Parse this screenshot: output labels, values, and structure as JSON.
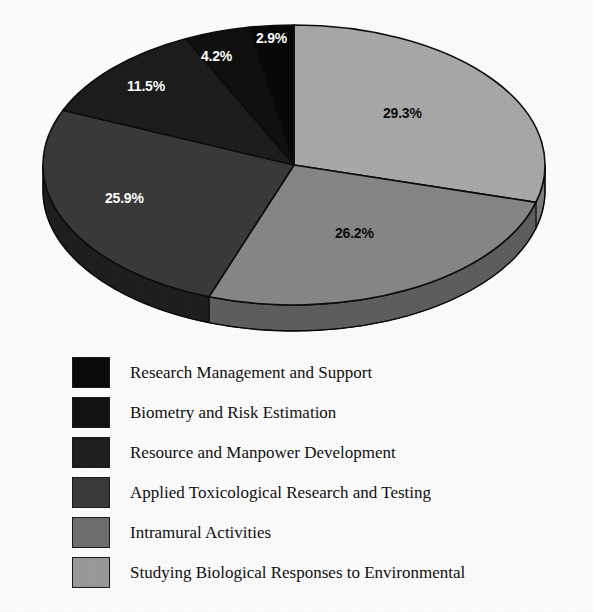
{
  "chart_data": {
    "type": "pie",
    "title": "",
    "subtitle": "",
    "xlabel": "",
    "ylabel": "",
    "grid": false,
    "legend_position": "below",
    "three_d": true,
    "start_angle_deg": 0,
    "direction": "clockwise",
    "categories": [
      "Studying Biological Responses to Environmental",
      "Intramural Activities",
      "Applied Toxicological Research and Testing",
      "Resource and Manpower Development",
      "Biometry and Risk Estimation",
      "Research Management and Support"
    ],
    "values": [
      29.3,
      26.2,
      25.9,
      11.5,
      4.2,
      2.9
    ],
    "value_labels": [
      "29.3%",
      "26.2%",
      "25.9%",
      "11.5%",
      "4.2%",
      "2.9%"
    ],
    "colors": [
      "#a9a9a9",
      "#878787",
      "#3a3a3a",
      "#1d1d1d",
      "#101010",
      "#080808"
    ],
    "label_text_colors": [
      "#0d0d0d",
      "#0d0d0d",
      "#ffffff",
      "#ffffff",
      "#ffffff",
      "#ffffff"
    ],
    "units": "percent",
    "total": 100.0
  },
  "pie": {
    "slices": [
      {
        "name": "slice-studying-biological-responses",
        "label": "29.3%",
        "value": 29.3,
        "color": "#a9a9a9",
        "side_color": "#7e7e7e",
        "text_color": "#0d0d0d",
        "label_x": 383,
        "label_y": 105
      },
      {
        "name": "slice-intramural-activities",
        "label": "26.2%",
        "value": 26.2,
        "color": "#878787",
        "side_color": "#5e5e5e",
        "text_color": "#0d0d0d",
        "label_x": 335,
        "label_y": 225
      },
      {
        "name": "slice-applied-toxicological-research",
        "label": "25.9%",
        "value": 25.9,
        "color": "#3a3a3a",
        "side_color": "#1f1f1f",
        "text_color": "#ffffff",
        "label_x": 105,
        "label_y": 190
      },
      {
        "name": "slice-resource-and-manpower-development",
        "label": "11.5%",
        "value": 11.5,
        "color": "#1d1d1d",
        "side_color": "#121212",
        "text_color": "#ffffff",
        "label_x": 127,
        "label_y": 78
      },
      {
        "name": "slice-biometry-and-risk-estimation",
        "label": "4.2%",
        "value": 4.2,
        "color": "#101010",
        "side_color": "#0a0a0a",
        "text_color": "#ffffff",
        "label_x": 201,
        "label_y": 48
      },
      {
        "name": "slice-research-management-and-support",
        "label": "2.9%",
        "value": 2.9,
        "color": "#080808",
        "side_color": "#050505",
        "text_color": "#ffffff",
        "label_x": 256,
        "label_y": 30
      }
    ]
  },
  "legend": {
    "items": [
      {
        "label": "Research Management and Support",
        "color": "#0b0b0b",
        "value": 2.9
      },
      {
        "label": "Biometry and Risk Estimation",
        "color": "#121212",
        "value": 4.2
      },
      {
        "label": "Resource and Manpower Development",
        "color": "#202020",
        "value": 11.5
      },
      {
        "label": "Applied Toxicological Research and Testing",
        "color": "#3b3b3b",
        "value": 25.9
      },
      {
        "label": "Intramural Activities",
        "color": "#6f6f6f",
        "value": 26.2
      },
      {
        "label": "Studying Biological Responses to Environmental",
        "color": "#9a9a9a",
        "value": 29.3
      }
    ]
  }
}
